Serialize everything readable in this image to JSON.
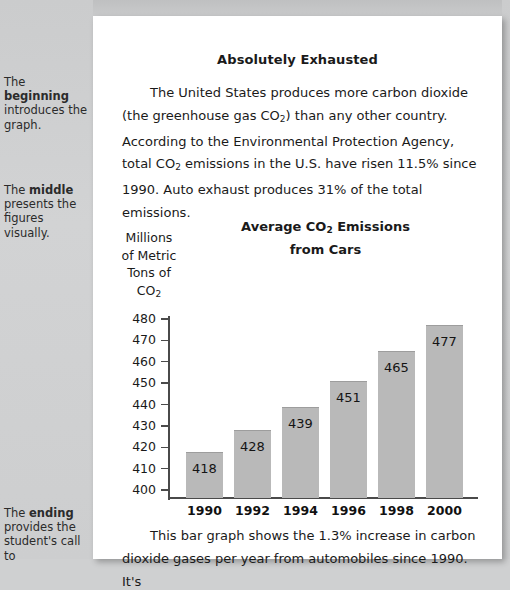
{
  "margin_notes": [
    {
      "id": "beginning",
      "pre": "The ",
      "bold": "beginning",
      "post": " introduces the graph."
    },
    {
      "id": "middle",
      "pre": "The ",
      "bold": "middle",
      "post": " presents the figures visually."
    },
    {
      "id": "ending",
      "pre": "The ",
      "bold": "ending",
      "post": " provides the student's call to"
    }
  ],
  "article": {
    "title": "Absolutely Exhausted",
    "intro_paragraph": "The United States produces more carbon dioxide (the greenhouse gas CO2) than any other country. According to the Environmental Protection Agency, total CO2 emissions in the U.S. have risen 11.5% since 1990. Auto exhaust produces 31% of the total emissions.",
    "closing_paragraph": "This bar graph shows the 1.3% increase in carbon dioxide gases per year from automobiles since 1990. It's"
  },
  "chart_data": {
    "type": "bar",
    "title_line1": "Average CO2 Emissions",
    "title_line2": "from Cars",
    "ylabel": "Millions of Metric Tons of CO2",
    "ylabel_lines": [
      "Millions",
      "of Metric",
      "Tons of",
      "CO2"
    ],
    "xlabel": "",
    "categories": [
      "1990",
      "1992",
      "1994",
      "1996",
      "1998",
      "2000"
    ],
    "values": [
      418,
      428,
      439,
      451,
      465,
      477
    ],
    "yticks": [
      400,
      410,
      420,
      430,
      440,
      450,
      460,
      470,
      480
    ],
    "ylim": [
      396,
      484
    ],
    "grid": false,
    "legend": false,
    "bar_color": "#b9b9b9",
    "axis_color": "#4a4a4a"
  },
  "colors": {
    "page_background": "#cfd0d1",
    "sheet": "#ffffff",
    "text": "#1a1a1a"
  }
}
